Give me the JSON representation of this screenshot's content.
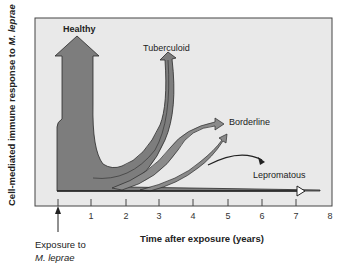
{
  "figure": {
    "y_axis_label_prefix": "Cell-mediated immune response to ",
    "y_axis_label_organism": "M. leprae",
    "x_axis_label": "Time after exposure (years)",
    "x_ticks": [
      "1",
      "2",
      "3",
      "4",
      "5",
      "6",
      "7",
      "8"
    ],
    "exposure_marker": {
      "line1": "Exposure to",
      "line2": "M. leprae"
    },
    "outcomes": [
      {
        "label": "Healthy"
      },
      {
        "label": "Tuberculoid"
      },
      {
        "label": "Borderline"
      },
      {
        "label": "Lepromatous"
      }
    ],
    "colors": {
      "plot_background": "#e9e9e9",
      "arrow_fill": "#7d7d7d",
      "outline": "#2a2a2a",
      "axis": "#444444"
    }
  }
}
